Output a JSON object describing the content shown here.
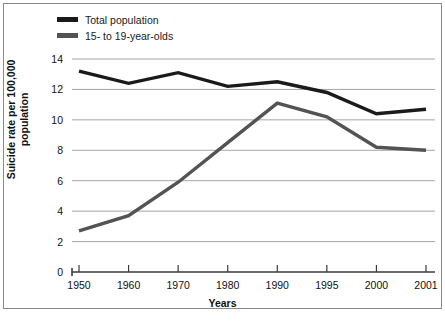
{
  "chart_data": {
    "type": "line",
    "title": "",
    "xlabel": "Years",
    "ylabel": "Suicide rate per 100,000 population",
    "ylabel_line1": "Suicide rate per 100,000",
    "ylabel_line2": "population",
    "categories": [
      "1950",
      "1960",
      "1970",
      "1980",
      "1990",
      "1995",
      "2000",
      "2001"
    ],
    "ylim": [
      0,
      14
    ],
    "ytick_labels": [
      "0",
      "2",
      "4",
      "6",
      "8",
      "10",
      "12",
      "14"
    ],
    "ytick_values": [
      0,
      2,
      4,
      6,
      8,
      10,
      12,
      14
    ],
    "grid": true,
    "grid_axis": "y",
    "legend_position": "top-left",
    "series": [
      {
        "name": "Total population",
        "color": "#1a1a1a",
        "values": [
          13.2,
          12.4,
          13.1,
          12.2,
          12.5,
          11.8,
          10.4,
          10.7
        ]
      },
      {
        "name": "15- to 19-year-olds",
        "color": "#535353",
        "values": [
          2.7,
          3.7,
          5.9,
          8.5,
          11.1,
          10.2,
          8.2,
          8.0
        ]
      }
    ]
  },
  "colors": {
    "series_total": "#1a1a1a",
    "series_teens": "#535353",
    "grid": "#a6a6a6",
    "axis": "#3a3a3a",
    "frame": "#8a8a8a",
    "background": "#ffffff"
  }
}
